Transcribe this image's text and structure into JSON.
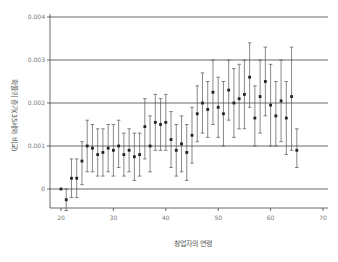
{
  "chart_data": {
    "type": "scatter",
    "subtype": "point-with-error-bars",
    "title": "",
    "xlabel": "창업자의 연령",
    "ylabel": "확률의 증가(35세와 비교)",
    "xlim": [
      19,
      71
    ],
    "ylim": [
      -0.0006,
      0.0041
    ],
    "xticks": [
      20,
      30,
      40,
      50,
      60,
      70
    ],
    "yticks": [
      0,
      0.001,
      0.002,
      0.003,
      0.004
    ],
    "xtick_labels": [
      "20",
      "30",
      "40",
      "50",
      "60",
      "70"
    ],
    "ytick_labels": [
      "0",
      "0.001",
      "0.002",
      "0.003",
      "0.004"
    ],
    "grid": "horizontal",
    "legend": null,
    "series": [
      {
        "name": "estimate",
        "x": [
          20,
          21,
          22,
          23,
          24,
          25,
          26,
          27,
          28,
          29,
          30,
          31,
          32,
          33,
          34,
          35,
          36,
          37,
          38,
          39,
          40,
          41,
          42,
          43,
          44,
          45,
          46,
          47,
          48,
          49,
          50,
          51,
          52,
          53,
          54,
          55,
          56,
          57,
          58,
          59,
          60,
          61,
          62,
          63,
          64,
          65
        ],
        "values": [
          0.0,
          -0.00025,
          0.00025,
          0.00025,
          0.00065,
          0.001,
          0.00095,
          0.0008,
          0.00085,
          0.00095,
          0.0009,
          0.001,
          0.0008,
          0.0009,
          0.00075,
          0.0008,
          0.00145,
          0.001,
          0.00155,
          0.0015,
          0.00155,
          0.00115,
          0.0009,
          0.00105,
          0.00085,
          0.00125,
          0.00175,
          0.002,
          0.00185,
          0.00225,
          0.0019,
          0.00175,
          0.0023,
          0.002,
          0.0021,
          0.0022,
          0.0026,
          0.00165,
          0.00215,
          0.0025,
          0.00195,
          0.0017,
          0.00205,
          0.00165,
          0.00215,
          0.0009
        ],
        "lower": [
          0.0,
          -0.0005,
          -0.0002,
          -0.0002,
          0.0001,
          0.0004,
          0.0004,
          0.0003,
          0.0003,
          0.0004,
          0.0003,
          0.0005,
          0.0003,
          0.0004,
          0.0002,
          0.0003,
          0.0007,
          0.0004,
          0.0009,
          0.0009,
          0.0009,
          0.0005,
          0.0003,
          0.0004,
          0.0002,
          0.0006,
          0.0011,
          0.0013,
          0.0012,
          0.0015,
          0.0012,
          0.001,
          0.0016,
          0.0012,
          0.0014,
          0.0014,
          0.0019,
          0.001,
          0.0013,
          0.0017,
          0.001,
          0.001,
          0.0011,
          0.0008,
          0.0009,
          0.0005
        ],
        "upper": [
          0.0,
          0.0,
          0.0007,
          0.0007,
          0.0011,
          0.0016,
          0.0015,
          0.0014,
          0.0014,
          0.0015,
          0.0015,
          0.0016,
          0.0013,
          0.0014,
          0.0013,
          0.0013,
          0.0021,
          0.0017,
          0.0022,
          0.0021,
          0.0022,
          0.0018,
          0.0015,
          0.0017,
          0.0015,
          0.0019,
          0.0024,
          0.0027,
          0.0025,
          0.003,
          0.0026,
          0.0025,
          0.003,
          0.0028,
          0.0029,
          0.003,
          0.0034,
          0.0024,
          0.003,
          0.0033,
          0.0029,
          0.0025,
          0.003,
          0.0025,
          0.0033,
          0.0014
        ]
      }
    ],
    "colors": {
      "points": "#222222",
      "error_bars": "#555555",
      "grid": "#444444",
      "axis": "#444444"
    }
  }
}
